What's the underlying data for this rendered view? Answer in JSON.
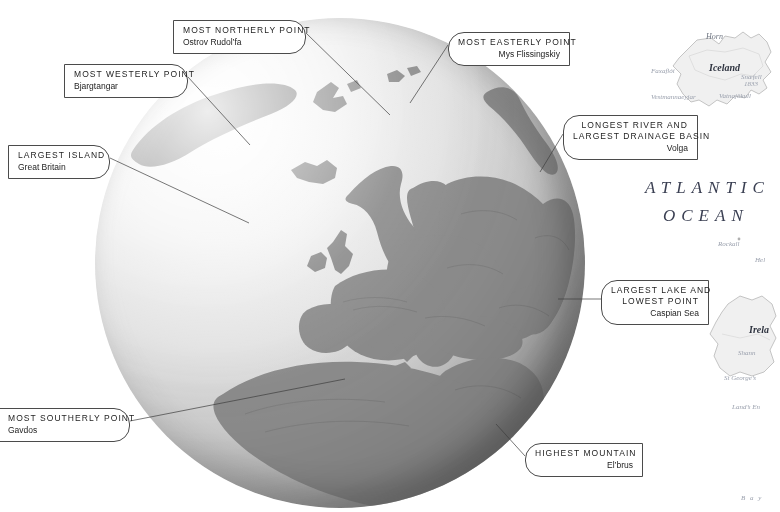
{
  "figure": {
    "kind": "annotated-globe-map",
    "region": "Europe",
    "projection": "orthographic globe centred on Europe"
  },
  "callouts": [
    {
      "name": "most-northerly-point",
      "title": "MOST NORTHERLY POINT",
      "value": "Ostrov Rudol’fa",
      "side": "r",
      "box": {
        "x": 173,
        "y": 20,
        "w": 133,
        "h": 26
      },
      "leader": {
        "x1": 306,
        "y1": 33,
        "x2": 390,
        "y2": 115
      }
    },
    {
      "name": "most-westerly-point",
      "title": "MOST WESTERLY POINT",
      "value": "Bjargtangar",
      "side": "r",
      "box": {
        "x": 64,
        "y": 64,
        "w": 124,
        "h": 26
      },
      "leader": {
        "x1": 188,
        "y1": 77,
        "x2": 248,
        "y2": 143
      }
    },
    {
      "name": "largest-island",
      "title": "LARGEST ISLAND",
      "value": "Great Britain",
      "side": "r",
      "box": {
        "x": 8,
        "y": 145,
        "w": 102,
        "h": 26
      },
      "leader": {
        "x1": 110,
        "y1": 158,
        "x2": 248,
        "y2": 222
      }
    },
    {
      "name": "most-easterly-point",
      "title": "MOST EASTERLY POINT",
      "value": "Mys Flissingskiy",
      "side": "l",
      "box": {
        "x": 448,
        "y": 32,
        "w": 122,
        "h": 26
      },
      "leader": {
        "x1": 448,
        "y1": 45,
        "x2": 412,
        "y2": 105
      }
    },
    {
      "name": "longest-river-and-largest-drainage-basin",
      "title": "LONGEST RIVER AND",
      "title2": "LARGEST DRAINAGE BASIN",
      "value": "Volga",
      "side": "l",
      "box": {
        "x": 563,
        "y": 115,
        "w": 135,
        "h": 38
      },
      "leader": {
        "x1": 563,
        "y1": 134,
        "x2": 543,
        "y2": 174
      }
    },
    {
      "name": "largest-lake-and-lowest-point",
      "title": "LARGEST LAKE AND",
      "title2": "LOWEST POINT",
      "value": "Caspian Sea",
      "side": "l",
      "box": {
        "x": 601,
        "y": 280,
        "w": 108,
        "h": 38
      },
      "leader": {
        "x1": 601,
        "y1": 299,
        "x2": 561,
        "y2": 299
      }
    },
    {
      "name": "highest-mountain",
      "title": "HIGHEST MOUNTAIN",
      "value": "El’brus",
      "side": "l",
      "box": {
        "x": 525,
        "y": 443,
        "w": 118,
        "h": 26
      },
      "leader": {
        "x1": 525,
        "y1": 456,
        "x2": 497,
        "y2": 425
      }
    },
    {
      "name": "most-southerly-point",
      "title": "MOST SOUTHERLY POINT",
      "value": "Gavdos",
      "side": "r",
      "box": {
        "x": 0,
        "y": 408,
        "w": 130,
        "h": 26
      },
      "leader": {
        "x1": 130,
        "y1": 421,
        "x2": 342,
        "y2": 380
      }
    }
  ],
  "background_map": {
    "ocean_labels": [
      {
        "name": "atlantic",
        "text": "ATLANTIC",
        "x": 645,
        "y": 188
      },
      {
        "name": "ocean",
        "text": "OCEAN",
        "x": 663,
        "y": 216
      }
    ],
    "place_labels": [
      {
        "name": "iceland",
        "text": "Iceland",
        "x": 709,
        "y": 68,
        "style": "big"
      },
      {
        "name": "horn",
        "text": "Horn",
        "x": 706,
        "y": 38,
        "style": "mid"
      },
      {
        "name": "faxafloi",
        "text": "Faxaflói",
        "x": 655,
        "y": 71,
        "style": ""
      },
      {
        "name": "vestmannaeyjar",
        "text": "Vestmannaeyjar",
        "x": 657,
        "y": 97,
        "style": ""
      },
      {
        "name": "snaefell",
        "text": "Snæfell",
        "x": 741,
        "y": 77,
        "style": ""
      },
      {
        "name": "snaefell-elev",
        "text": "1833",
        "x": 744,
        "y": 83,
        "style": ""
      },
      {
        "name": "vatnajokull",
        "text": "Vatnajökull",
        "x": 722,
        "y": 96,
        "style": ""
      },
      {
        "name": "rockall",
        "text": "Rockall",
        "x": 720,
        "y": 243,
        "style": ""
      },
      {
        "name": "helgoland",
        "text": "Hel",
        "x": 757,
        "y": 259,
        "style": ""
      },
      {
        "name": "ireland",
        "text": "Irela",
        "x": 749,
        "y": 330,
        "style": "big"
      },
      {
        "name": "shannon",
        "text": "Shann",
        "x": 740,
        "y": 352,
        "style": ""
      },
      {
        "name": "st-georges-channel",
        "text": "St George’s",
        "x": 727,
        "y": 377,
        "style": ""
      },
      {
        "name": "lands-end",
        "text": "Land’s En",
        "x": 734,
        "y": 406,
        "style": ""
      },
      {
        "name": "bay",
        "text": "B a y",
        "x": 743,
        "y": 497,
        "style": ""
      }
    ]
  }
}
